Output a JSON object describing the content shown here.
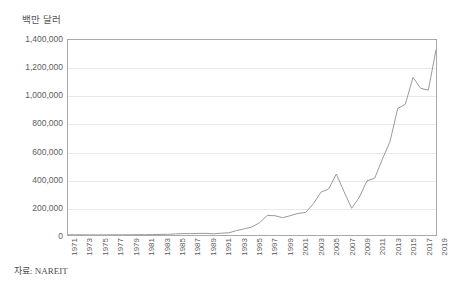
{
  "chart_data": {
    "type": "line",
    "title": "백만 달러",
    "xlabel": "",
    "ylabel": "백만 달러",
    "ylim": [
      0,
      1400000
    ],
    "xlim": [
      1971,
      2019
    ],
    "grid": true,
    "legend": false,
    "series_color": "#9a9a9a",
    "grid_color": "#e9e9e9",
    "axis_color": "#a9a9a9",
    "source_note": "자료: NAREIT",
    "y_ticks": [
      0,
      200000,
      400000,
      600000,
      800000,
      1000000,
      1200000,
      1400000
    ],
    "y_tick_labels": [
      "0",
      "200,000",
      "400,000",
      "600,000",
      "800,000",
      "1,000,000",
      "1,200,000",
      "1,400,000"
    ],
    "x_tick_labels": [
      "1971",
      "1973",
      "1975",
      "1977",
      "1979",
      "1981",
      "1983",
      "1985",
      "1987",
      "1989",
      "1991",
      "1993",
      "1995",
      "1997",
      "1999",
      "2001",
      "2003",
      "2005",
      "2007",
      "2009",
      "2011",
      "2013",
      "2015",
      "2017",
      "2019"
    ],
    "x": [
      1971,
      1972,
      1973,
      1974,
      1975,
      1976,
      1977,
      1978,
      1979,
      1980,
      1981,
      1982,
      1983,
      1984,
      1985,
      1986,
      1987,
      1988,
      1989,
      1990,
      1991,
      1992,
      1993,
      1994,
      1995,
      1996,
      1997,
      1998,
      1999,
      2000,
      2001,
      2002,
      2003,
      2004,
      2005,
      2006,
      2007,
      2008,
      2009,
      2010,
      2011,
      2012,
      2013,
      2014,
      2015,
      2016,
      2017,
      2018,
      2019
    ],
    "values": [
      1494,
      1880,
      1394,
      712,
      900,
      1308,
      1528,
      1412,
      1754,
      2299,
      2439,
      3299,
      4257,
      5085,
      7674,
      9924,
      9702,
      11435,
      11662,
      8737,
      12968,
      15912,
      32159,
      44306,
      57541,
      88776,
      140534,
      138301,
      124262,
      138715,
      154899,
      161937,
      224212,
      307894,
      330691,
      438071,
      312009,
      191651,
      271199,
      389295,
      407023,
      544000,
      670334,
      907425,
      939000,
      1132000,
      1053000,
      1040000,
      1328807
    ],
    "annotations": []
  },
  "figure": {
    "unit_title": "백만 달러",
    "source_note": "자료: NAREIT"
  }
}
